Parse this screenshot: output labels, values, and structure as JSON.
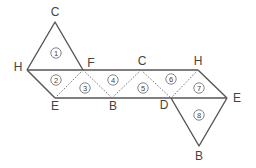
{
  "figure": {
    "vertex_labels": {
      "C_top": "C",
      "H_left": "H",
      "F": "F",
      "E_left": "E",
      "B_mid": "B",
      "C_mid": "C",
      "H_right": "H",
      "D": "D",
      "E_right": "E",
      "B_bottom": "B"
    },
    "face_labels": [
      "1",
      "2",
      "3",
      "4",
      "5",
      "6",
      "7",
      "8"
    ],
    "colors": {
      "line": "#555555",
      "text": "#444444",
      "background": "#ffffff"
    }
  }
}
